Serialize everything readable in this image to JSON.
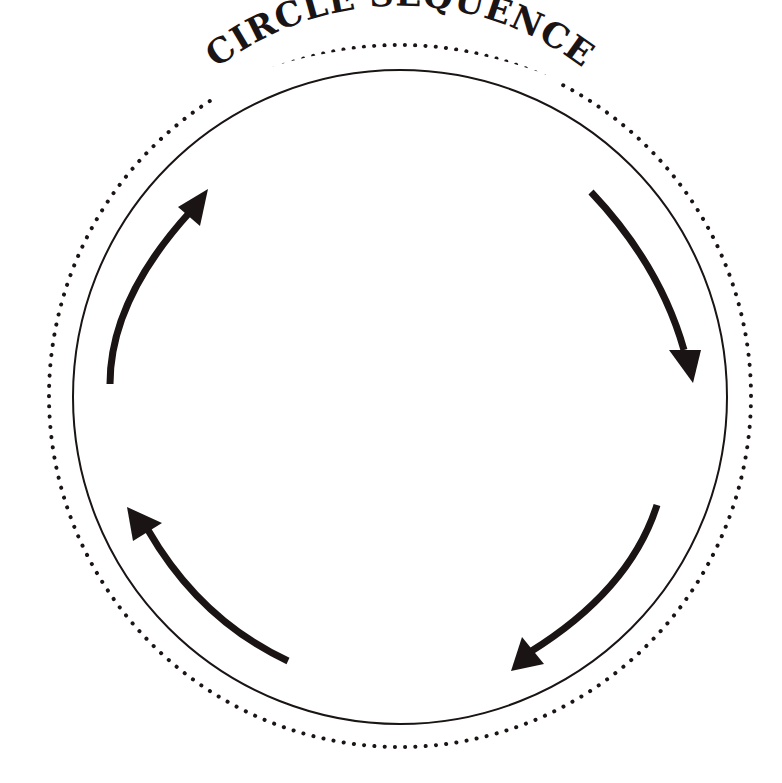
{
  "diagram": {
    "title": "CIRCLE SEQUENCE",
    "type": "circle-sequence",
    "arrow_count": 4,
    "arrow_direction": "clockwise",
    "colors": {
      "ink": "#1a1414",
      "background": "#ffffff"
    },
    "arrows": [
      {
        "id": "top-right",
        "direction": "down-right"
      },
      {
        "id": "bottom-right",
        "direction": "down-left"
      },
      {
        "id": "bottom-left",
        "direction": "up-left"
      },
      {
        "id": "top-left",
        "direction": "up-right"
      }
    ]
  }
}
